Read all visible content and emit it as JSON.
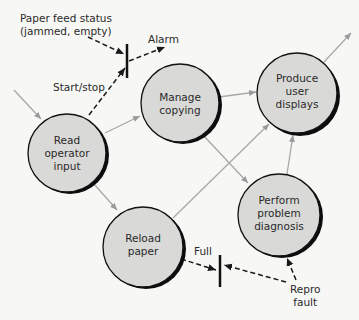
{
  "colors": {
    "node_fill": "#d9d9d7",
    "node_outline": "#111111",
    "flow_line": "#a8a8a8",
    "control_line": "#1a1a1a",
    "background": "#f7f7f5"
  },
  "nodes": [
    {
      "id": "read-operator-input",
      "lines": [
        "Read",
        "operator",
        "input"
      ]
    },
    {
      "id": "manage-copying",
      "lines": [
        "Manage",
        "copying"
      ]
    },
    {
      "id": "produce-user-displays",
      "lines": [
        "Produce",
        "user",
        "displays"
      ]
    },
    {
      "id": "reload-paper",
      "lines": [
        "Reload",
        "paper"
      ]
    },
    {
      "id": "perform-problem-diagnosis",
      "lines": [
        "Perform",
        "problem",
        "diagnosis"
      ]
    }
  ],
  "labels": {
    "paper_feed_status_line1": "Paper feed status",
    "paper_feed_status_line2": "(jammed, empty)",
    "alarm": "Alarm",
    "start_stop": "Start/stop",
    "full": "Full",
    "repro_fault_line1": "Repro",
    "repro_fault_line2": "fault"
  },
  "flows": [
    {
      "from": "external",
      "to": "read-operator-input",
      "type": "data"
    },
    {
      "from": "read-operator-input",
      "to": "manage-copying",
      "type": "data"
    },
    {
      "from": "read-operator-input",
      "to": "reload-paper",
      "type": "data"
    },
    {
      "from": "manage-copying",
      "to": "produce-user-displays",
      "type": "data"
    },
    {
      "from": "manage-copying",
      "to": "perform-problem-diagnosis",
      "type": "data"
    },
    {
      "from": "reload-paper",
      "to": "produce-user-displays",
      "type": "data"
    },
    {
      "from": "perform-problem-diagnosis",
      "to": "produce-user-displays",
      "type": "data"
    },
    {
      "from": "produce-user-displays",
      "to": "external",
      "type": "data"
    },
    {
      "from": "paper-feed-status",
      "to": "bar-top",
      "type": "control"
    },
    {
      "from": "read-operator-input",
      "to": "bar-top",
      "type": "control",
      "label": "Start/stop"
    },
    {
      "from": "bar-top",
      "to": "alarm",
      "type": "control"
    },
    {
      "from": "reload-paper",
      "to": "bar-bottom",
      "type": "control",
      "label": "Full"
    },
    {
      "from": "repro-fault",
      "to": "bar-bottom",
      "type": "control"
    },
    {
      "from": "repro-fault",
      "to": "perform-problem-diagnosis",
      "type": "control"
    }
  ]
}
